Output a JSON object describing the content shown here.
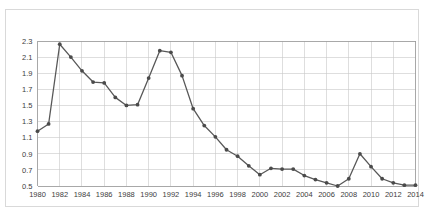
{
  "chart_data": {
    "type": "line",
    "title": "",
    "subtitle": "",
    "xlabel": "",
    "ylabel": "",
    "grid": true,
    "legend": false,
    "legend_position": "none",
    "marker": "filled-circle",
    "line_color": "#585858",
    "marker_color": "#4a4a4a",
    "grid_color": "#c8c8c8",
    "xlim": [
      1980,
      2014
    ],
    "ylim": [
      0.5,
      2.3
    ],
    "yticks": [
      0.5,
      0.7,
      0.9,
      1.1,
      1.3,
      1.5,
      1.7,
      1.9,
      2.1,
      2.3
    ],
    "ytick_labels": [
      "0.5",
      "0.7",
      "0.9",
      "1.1",
      "1.3",
      "1.5",
      "1.7",
      "1.9",
      "2.1",
      "2.3"
    ],
    "xticks": [
      1980,
      1982,
      1984,
      1986,
      1988,
      1990,
      1992,
      1994,
      1996,
      1998,
      2000,
      2002,
      2004,
      2006,
      2008,
      2010,
      2012,
      2014
    ],
    "xtick_labels": [
      "1980",
      "1982",
      "1984",
      "1986",
      "1988",
      "1990",
      "1992",
      "1994",
      "1996",
      "1998",
      "2000",
      "2002",
      "2004",
      "2006",
      "2008",
      "2010",
      "2012",
      "2014"
    ],
    "x": [
      1980,
      1981,
      1982,
      1983,
      1984,
      1985,
      1986,
      1987,
      1988,
      1989,
      1990,
      1991,
      1992,
      1993,
      1994,
      1995,
      1996,
      1997,
      1998,
      1999,
      2000,
      2001,
      2002,
      2003,
      2004,
      2005,
      2006,
      2007,
      2008,
      2009,
      2010,
      2011,
      2012,
      2013,
      2014
    ],
    "values": [
      1.18,
      1.27,
      2.26,
      2.1,
      1.93,
      1.79,
      1.78,
      1.6,
      1.5,
      1.51,
      1.84,
      2.18,
      2.16,
      1.87,
      1.46,
      1.25,
      1.11,
      0.95,
      0.87,
      0.75,
      0.64,
      0.72,
      0.71,
      0.71,
      0.63,
      0.58,
      0.54,
      0.5,
      0.59,
      0.9,
      0.74,
      0.59,
      0.54,
      0.51,
      0.51
    ]
  }
}
